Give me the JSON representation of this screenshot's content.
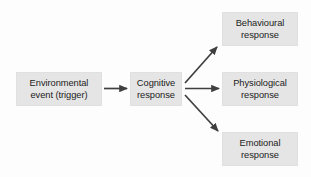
{
  "diagram": {
    "background_color": "#fdfdfd",
    "box_fill_color": "#e5e5e5",
    "arrow_color": "#3f3f3f",
    "text_color": "#1b1b1b",
    "nodes": [
      {
        "id": "environmental-event",
        "label": "Environmental\nevent (trigger)",
        "line1": "Environmental",
        "line2": "event (trigger)"
      },
      {
        "id": "cognitive-response",
        "label": "Cognitive\nresponse",
        "line1": "Cognitive",
        "line2": "response"
      },
      {
        "id": "behavioural-response",
        "label": "Behavioural\nresponse",
        "line1": "Behavioural",
        "line2": "response"
      },
      {
        "id": "physiological-response",
        "label": "Physiological\nresponse",
        "line1": "Physiological",
        "line2": "response"
      },
      {
        "id": "emotional-response",
        "label": "Emotional\nresponse",
        "line1": "Emotional",
        "line2": "response"
      }
    ],
    "connectors": [
      {
        "id": "arrow-environmental-to-cognitive",
        "from": "environmental-event",
        "to": "cognitive-response",
        "direction": "right"
      },
      {
        "id": "arrow-cognitive-to-behavioural",
        "from": "cognitive-response",
        "to": "behavioural-response",
        "direction": "up-right"
      },
      {
        "id": "arrow-cognitive-to-physiological",
        "from": "cognitive-response",
        "to": "physiological-response",
        "direction": "right"
      },
      {
        "id": "arrow-cognitive-to-emotional",
        "from": "cognitive-response",
        "to": "emotional-response",
        "direction": "down-right"
      }
    ]
  }
}
